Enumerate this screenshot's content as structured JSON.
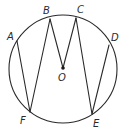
{
  "diagram": {
    "type": "geometry-circle",
    "circle": {
      "center": "O",
      "cx": 63,
      "cy": 69,
      "r": 54
    },
    "points": [
      {
        "id": "A",
        "label": "A",
        "x": 17,
        "y": 41,
        "lx": 7,
        "ly": 40
      },
      {
        "id": "B",
        "label": "B",
        "x": 50,
        "y": 19,
        "lx": 43,
        "ly": 14
      },
      {
        "id": "C",
        "label": "C",
        "x": 76,
        "y": 18,
        "lx": 77,
        "ly": 13
      },
      {
        "id": "D",
        "label": "D",
        "x": 109,
        "y": 45,
        "lx": 111,
        "ly": 41
      },
      {
        "id": "E",
        "label": "E",
        "x": 92,
        "y": 114,
        "lx": 93,
        "ly": 127
      },
      {
        "id": "F",
        "label": "F",
        "x": 30,
        "y": 112,
        "lx": 20,
        "ly": 124
      },
      {
        "id": "O",
        "label": "O",
        "x": 63,
        "y": 68,
        "lx": 58,
        "ly": 81
      }
    ],
    "segments": [
      [
        "A",
        "F"
      ],
      [
        "F",
        "B"
      ],
      [
        "B",
        "O"
      ],
      [
        "O",
        "C"
      ],
      [
        "C",
        "E"
      ],
      [
        "E",
        "D"
      ]
    ],
    "colors": {
      "stroke": "#2a2a2a",
      "background": "#ffffff"
    }
  }
}
